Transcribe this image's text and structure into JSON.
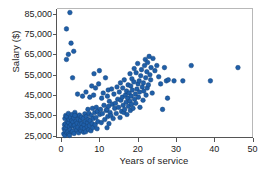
{
  "chart_data": {
    "type": "scatter",
    "title": "",
    "xlabel": "Years of service",
    "ylabel": "Salary ($)",
    "xlim": [
      -1.2,
      50
    ],
    "ylim": [
      24200,
      87500
    ],
    "xticks": [
      0,
      10,
      20,
      30,
      40,
      50
    ],
    "xticklabels": [
      "0",
      "10",
      "20",
      "30",
      "40",
      "50"
    ],
    "yticks": [
      25000,
      35000,
      45000,
      55000,
      65000,
      75000,
      85000
    ],
    "yticklabels": [
      "25,000",
      "35,000",
      "45,000",
      "55,000",
      "65,000",
      "75,000",
      "85,000"
    ],
    "grid": false,
    "legend": null,
    "marker": {
      "shape": "circle",
      "color": "#1f5fa9",
      "edge_color": "#17447a",
      "size_px": 4.6,
      "opacity": 1
    },
    "frame_color": "#b8b8b8",
    "axis_color": "#555555",
    "series": [
      {
        "name": "Employees",
        "n_points": 201,
        "x": [
          0.7,
          0.8,
          0.9,
          1.0,
          1.0,
          1.1,
          1.2,
          1.2,
          1.3,
          1.4,
          1.5,
          1.5,
          1.6,
          1.7,
          1.8,
          1.9,
          2.0,
          2.0,
          2.1,
          2.2,
          2.3,
          2.4,
          2.5,
          2.6,
          2.7,
          2.8,
          2.9,
          3.0,
          3.0,
          3.1,
          3.2,
          3.3,
          3.4,
          3.5,
          3.6,
          3.8,
          3.9,
          4.0,
          4.1,
          4.2,
          4.3,
          4.4,
          4.5,
          4.6,
          4.8,
          4.9,
          5.0,
          5.1,
          5.2,
          5.3,
          5.4,
          5.5,
          5.6,
          5.8,
          5.9,
          6.0,
          6.1,
          6.2,
          6.3,
          6.4,
          6.5,
          6.6,
          6.8,
          6.9,
          7.0,
          7.1,
          7.2,
          7.3,
          7.4,
          7.5,
          7.6,
          7.8,
          7.9,
          8.0,
          8.1,
          8.2,
          8.3,
          8.4,
          8.5,
          8.6,
          8.8,
          8.9,
          9.0,
          9.1,
          9.2,
          9.4,
          9.5,
          9.6,
          9.8,
          10.0,
          10.1,
          10.3,
          10.5,
          10.6,
          10.8,
          11.0,
          11.2,
          11.4,
          11.6,
          11.8,
          12.0,
          12.0,
          12.1,
          12.2,
          12.3,
          12.4,
          12.5,
          12.6,
          12.8,
          13.0,
          13.2,
          13.4,
          13.6,
          13.8,
          14.0,
          14.2,
          14.4,
          14.6,
          14.8,
          15.0,
          15.2,
          15.4,
          15.5,
          15.6,
          15.8,
          16.0,
          16.1,
          16.2,
          16.4,
          16.5,
          16.6,
          16.8,
          17.0,
          17.1,
          17.2,
          17.4,
          17.5,
          17.6,
          17.8,
          18.0,
          18.0,
          18.1,
          18.2,
          18.3,
          18.4,
          18.5,
          18.6,
          18.8,
          19.0,
          19.1,
          19.2,
          19.4,
          19.5,
          19.6,
          19.8,
          20.0,
          20.1,
          20.2,
          20.4,
          20.5,
          20.6,
          20.8,
          21.0,
          21.2,
          21.4,
          21.5,
          21.6,
          21.8,
          22.0,
          22.1,
          22.2,
          22.4,
          22.5,
          22.6,
          22.8,
          23.0,
          23.2,
          23.4,
          23.5,
          23.8,
          24.0,
          24.5,
          25.0,
          25.5,
          26.0,
          26.5,
          27.0,
          27.5,
          27.8,
          28.0,
          29.5,
          31.8,
          34.0,
          39.0,
          46.2,
          1.4,
          1.9,
          2.6,
          3.3,
          3.6,
          2.2
        ],
        "y": [
          26000,
          28500,
          30500,
          25200,
          33500,
          27500,
          31000,
          35000,
          29000,
          62500,
          26500,
          34500,
          30000,
          32000,
          27000,
          36000,
          25800,
          31500,
          33000,
          29500,
          85500,
          28000,
          34000,
          30500,
          26800,
          32500,
          35500,
          27200,
          53500,
          31800,
          29800,
          33800,
          26200,
          30200,
          36500,
          28800,
          32200,
          34800,
          27800,
          31200,
          45500,
          29200,
          33200,
          26500,
          35200,
          30800,
          28200,
          32800,
          27500,
          34200,
          31000,
          29000,
          44500,
          33500,
          26800,
          30500,
          28500,
          35800,
          32000,
          27000,
          46500,
          34500,
          29500,
          31500,
          38000,
          33000,
          28000,
          36000,
          30000,
          44000,
          32500,
          27500,
          35000,
          49500,
          31000,
          38500,
          29000,
          33500,
          45000,
          55500,
          36500,
          30500,
          48500,
          34000,
          39000,
          28500,
          37000,
          32000,
          50500,
          57000,
          35500,
          38000,
          31500,
          43500,
          36000,
          46000,
          40000,
          33000,
          53500,
          37500,
          38000,
          29000,
          44500,
          34500,
          47500,
          39500,
          31000,
          42000,
          36500,
          35000,
          48000,
          40500,
          33500,
          45500,
          38500,
          41000,
          36000,
          49000,
          43000,
          39000,
          46500,
          34000,
          51000,
          42500,
          37000,
          44000,
          48500,
          40000,
          36500,
          52500,
          38000,
          45000,
          41500,
          47000,
          35500,
          43500,
          50000,
          39500,
          46000,
          55500,
          42000,
          37500,
          49500,
          44500,
          40500,
          53000,
          47500,
          38500,
          51500,
          58000,
          43000,
          45500,
          41000,
          56000,
          48000,
          60500,
          50500,
          44000,
          52000,
          46500,
          39000,
          54500,
          57500,
          49000,
          42500,
          51000,
          47000,
          59500,
          62500,
          53500,
          45000,
          56500,
          48500,
          61000,
          50000,
          64000,
          55000,
          52500,
          58500,
          46000,
          63000,
          57000,
          59500,
          54000,
          50500,
          38000,
          58500,
          52000,
          43500,
          52500,
          52000,
          52000,
          59500,
          52000,
          58500,
          77500,
          65000,
          70500,
          66500,
          35000,
          25200
        ]
      }
    ]
  }
}
